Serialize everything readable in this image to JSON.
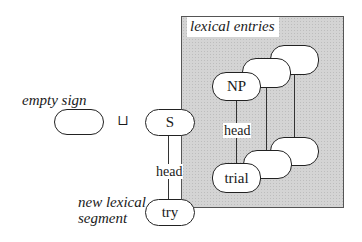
{
  "diagram": {
    "box_label": "lexical entries",
    "left_labels": {
      "empty_sign": "empty sign",
      "new_segment_line1": "new lexical",
      "new_segment_line2": "segment"
    },
    "operator": "⊔",
    "nodes": {
      "empty": "",
      "s": "S",
      "try": "try",
      "np": "NP",
      "trial": "trial",
      "back_top_1": "",
      "back_top_2": "",
      "back_bottom_1": "",
      "back_bottom_2": ""
    },
    "edges": {
      "s_try_label": "head",
      "np_trial_label": "head"
    },
    "colors": {
      "box_fill": "#d4d4d4",
      "box_border": "#555555",
      "node_fill": "#ffffff",
      "stroke": "#222222"
    }
  }
}
